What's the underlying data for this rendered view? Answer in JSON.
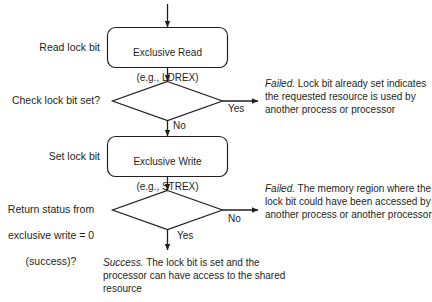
{
  "diagram": {
    "colors": {
      "stroke": "#231f20",
      "text": "#231f20",
      "background": "#ffffff"
    },
    "nodes": {
      "exclusive_read": {
        "line1": "Exclusive Read",
        "line2": "(e.g., LDREX)",
        "shape": "rounded-rect"
      },
      "check_lock": {
        "shape": "diamond"
      },
      "exclusive_write": {
        "line1": "Exclusive Write",
        "line2": "(e.g., STREX)",
        "shape": "rounded-rect"
      },
      "return_status": {
        "shape": "diamond"
      }
    },
    "side_labels": {
      "read_lock_bit": "Read lock bit",
      "check_lock_bit_set": "Check lock bit set?",
      "set_lock_bit": "Set lock bit",
      "return_status_line1": "Return status from",
      "return_status_line2": "exclusive write = 0",
      "return_status_line3": "(success)?"
    },
    "edge_labels": {
      "check_yes": "Yes",
      "check_no": "No",
      "status_no": "No",
      "status_yes": "Yes"
    },
    "annotations": {
      "failed_lock_set": {
        "lead": "Failed.",
        "body": " Lock bit already set indicates the requested resource is used by another process or processor"
      },
      "failed_memory_region": {
        "lead": "Failed.",
        "body": " The memory region where the lock bit could have been accessed by another process or another processor"
      },
      "success": {
        "lead": "Success.",
        "body": " The lock bit is set and the processor can have access to the shared resource"
      }
    }
  }
}
